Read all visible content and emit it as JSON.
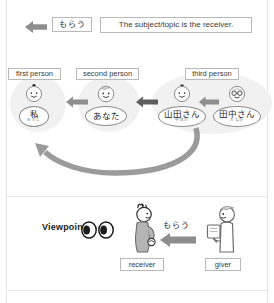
{
  "top_row": {
    "arrow_icon": "left-arrow-icon",
    "verb": "もらう",
    "sentence": "The subject/topic is the receiver."
  },
  "person_groups": [
    {
      "label": "first person",
      "people": [
        {
          "name": "私",
          "furigana": "わたし"
        }
      ]
    },
    {
      "label": "second person",
      "people": [
        {
          "name": "あなた",
          "furigana": ""
        }
      ]
    },
    {
      "label": "third person",
      "people": [
        {
          "name": "山田さん",
          "furigana": "やまだ"
        },
        {
          "name": "田中さん",
          "furigana": "たなか"
        }
      ]
    }
  ],
  "flow_arrows": {
    "between_2_and_1": "left-arrow-icon",
    "between_3_and_2": "left-arrow-icon",
    "within_3": "left-arrow-icon",
    "return_curve": "curved-left-arrow-icon"
  },
  "viewpoint_panel": {
    "label": "Viewpoint",
    "eyes_icon": "eyes-icon",
    "receiver_caption": "receiver",
    "giver_caption": "giver",
    "verb": "もらう",
    "arrow_icon": "left-arrow-icon"
  },
  "colors": {
    "arrow_gray": "#8e8e8e",
    "blob_gray": "#f1f1f1",
    "figure_fill": "#b4b4b4",
    "border_gray": "#b9b9b9",
    "text": "#3a3a3a"
  }
}
